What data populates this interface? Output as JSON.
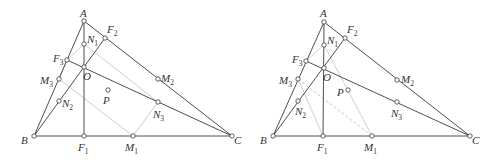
{
  "figures": [
    {
      "id": "left",
      "points": {
        "A": {
          "label": "A",
          "sub": "",
          "x": 84,
          "y": 21,
          "lx": 80,
          "ly": 17
        },
        "F2": {
          "label": "F",
          "sub": "2",
          "x": 105,
          "y": 38,
          "lx": 107,
          "ly": 33
        },
        "N1": {
          "label": "N",
          "sub": "1",
          "x": 84,
          "y": 44,
          "lx": 87,
          "ly": 43
        },
        "F3": {
          "label": "F",
          "sub": "3",
          "x": 67,
          "y": 60,
          "lx": 53,
          "ly": 62
        },
        "O": {
          "label": "O",
          "sub": "",
          "x": 84,
          "y": 67,
          "lx": 83,
          "ly": 80
        },
        "M3": {
          "label": "M",
          "sub": "3",
          "x": 59,
          "y": 79,
          "lx": 40,
          "ly": 84
        },
        "M2": {
          "label": "M",
          "sub": "2",
          "x": 158,
          "y": 79,
          "lx": 161,
          "ly": 82
        },
        "P": {
          "label": "P",
          "sub": "",
          "x": 108,
          "y": 90,
          "lx": 103,
          "ly": 104
        },
        "N2": {
          "label": "N",
          "sub": "2",
          "x": 59,
          "y": 101,
          "lx": 62,
          "ly": 107
        },
        "N3": {
          "label": "N",
          "sub": "3",
          "x": 158,
          "y": 102,
          "lx": 153,
          "ly": 118
        },
        "B": {
          "label": "B",
          "sub": "",
          "x": 34,
          "y": 136,
          "lx": 21,
          "ly": 144
        },
        "F1": {
          "label": "F",
          "sub": "1",
          "x": 84,
          "y": 136,
          "lx": 78,
          "ly": 151
        },
        "M1": {
          "label": "M",
          "sub": "1",
          "x": 133,
          "y": 136,
          "lx": 125,
          "ly": 151
        },
        "C": {
          "label": "C",
          "sub": "",
          "x": 232,
          "y": 136,
          "lx": 234,
          "ly": 144
        }
      },
      "solid_segments": [
        [
          "A",
          "B"
        ],
        [
          "A",
          "C"
        ],
        [
          "B",
          "C"
        ],
        [
          "A",
          "F1"
        ],
        [
          "B",
          "F2"
        ],
        [
          "C",
          "F3"
        ]
      ],
      "gray_segments": [
        [
          "N1",
          "N3"
        ],
        [
          "N3",
          "M1"
        ],
        [
          "M3",
          "M1"
        ],
        [
          "M3",
          "F3"
        ],
        [
          "F3",
          "N1"
        ]
      ],
      "dashed_segments": []
    },
    {
      "id": "right",
      "points": {
        "A": {
          "label": "A",
          "sub": "",
          "x": 324,
          "y": 22,
          "lx": 320,
          "ly": 17
        },
        "F2": {
          "label": "F",
          "sub": "2",
          "x": 345,
          "y": 38,
          "lx": 347,
          "ly": 33
        },
        "N1": {
          "label": "N",
          "sub": "1",
          "x": 324,
          "y": 45,
          "lx": 327,
          "ly": 44
        },
        "F3": {
          "label": "F",
          "sub": "3",
          "x": 306,
          "y": 61,
          "lx": 292,
          "ly": 63
        },
        "O": {
          "label": "O",
          "sub": "",
          "x": 324,
          "y": 68,
          "lx": 323,
          "ly": 81
        },
        "M3": {
          "label": "M",
          "sub": "3",
          "x": 298,
          "y": 79,
          "lx": 279,
          "ly": 84
        },
        "M2": {
          "label": "M",
          "sub": "2",
          "x": 397,
          "y": 80,
          "lx": 401,
          "ly": 83
        },
        "P": {
          "label": "P",
          "sub": "",
          "x": 348,
          "y": 90,
          "lx": 337,
          "ly": 96
        },
        "N2": {
          "label": "N",
          "sub": "2",
          "x": 298,
          "y": 101,
          "lx": 295,
          "ly": 115
        },
        "N3": {
          "label": "N",
          "sub": "3",
          "x": 397,
          "y": 102,
          "lx": 391,
          "ly": 117
        },
        "B": {
          "label": "B",
          "sub": "",
          "x": 273,
          "y": 136,
          "lx": 260,
          "ly": 144
        },
        "F1": {
          "label": "F",
          "sub": "1",
          "x": 323,
          "y": 136,
          "lx": 317,
          "ly": 151
        },
        "M1": {
          "label": "M",
          "sub": "1",
          "x": 372,
          "y": 136,
          "lx": 364,
          "ly": 151
        },
        "C": {
          "label": "C",
          "sub": "",
          "x": 470,
          "y": 136,
          "lx": 472,
          "ly": 144
        }
      },
      "solid_segments": [
        [
          "A",
          "B"
        ],
        [
          "A",
          "C"
        ],
        [
          "B",
          "C"
        ],
        [
          "A",
          "F1"
        ],
        [
          "B",
          "F2"
        ],
        [
          "C",
          "F3"
        ]
      ],
      "gray_segments": [
        [
          "N1",
          "M1"
        ],
        [
          "M3",
          "F1"
        ],
        [
          "F3",
          "N1"
        ]
      ],
      "dashed_segments": [
        [
          "M3",
          "M1"
        ]
      ]
    }
  ]
}
